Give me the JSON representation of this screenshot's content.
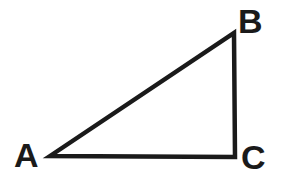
{
  "figure": {
    "kind": "geometry-diagram",
    "shape_name": "right-triangle",
    "background_color": "#ffffff",
    "stroke_color": "#1a1a1a",
    "stroke_width": 4.5,
    "width": 283,
    "height": 186
  },
  "labels": {
    "a": "A",
    "b": "B",
    "c": "C"
  },
  "chart_data": {
    "type": "scatter",
    "title": "",
    "xlabel": "",
    "ylabel": "",
    "series": [
      {
        "name": "triangle-ABC",
        "points": [
          {
            "label": "A",
            "x": 50,
            "y": 156
          },
          {
            "label": "B",
            "x": 234,
            "y": 33
          },
          {
            "label": "C",
            "x": 235,
            "y": 157
          }
        ],
        "closed": true
      }
    ],
    "edges": [
      {
        "name": "hypotenuse-AB",
        "from": "A",
        "to": "B"
      },
      {
        "name": "leg-BC",
        "from": "B",
        "to": "C"
      },
      {
        "name": "leg-AC",
        "from": "A",
        "to": "C"
      }
    ],
    "right_angle_at": "C"
  }
}
